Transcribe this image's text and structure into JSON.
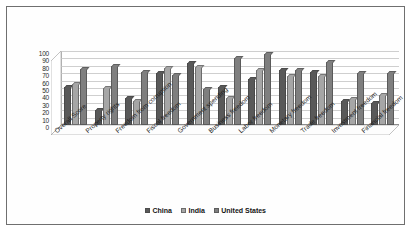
{
  "chart_data": {
    "type": "bar",
    "title": "",
    "subtitle": "",
    "xlabel": "",
    "ylabel": "",
    "ylim": [
      0,
      100
    ],
    "y_ticks": [
      100,
      90,
      80,
      70,
      60,
      50,
      40,
      30,
      20,
      10,
      0
    ],
    "grid": true,
    "legend_position": "bottom",
    "categories": [
      "Overall Score",
      "Property rights",
      "Freedom from corruption",
      "Fiscal freedom",
      "Government spending",
      "Business freedom",
      "Labor freedom",
      "Monetary freedom",
      "Trade freedom",
      "Investment freedom",
      "Financial freedom"
    ],
    "series": [
      {
        "name": "China",
        "color": "#595959",
        "values": [
          52,
          20,
          36,
          70,
          84,
          51,
          62,
          74,
          72,
          32,
          30
        ]
      },
      {
        "name": "India",
        "color": "#a6a6a6",
        "values": [
          55,
          50,
          33,
          77,
          78,
          37,
          74,
          66,
          66,
          35,
          40
        ]
      },
      {
        "name": "United States",
        "color": "#7f7f7f",
        "values": [
          76,
          80,
          71,
          67,
          48,
          91,
          96,
          74,
          85,
          70,
          70
        ]
      }
    ]
  },
  "legend": {
    "items": [
      {
        "label": "China",
        "color": "#595959"
      },
      {
        "label": "India",
        "color": "#a6a6a6"
      },
      {
        "label": "United States",
        "color": "#7f7f7f"
      }
    ]
  }
}
